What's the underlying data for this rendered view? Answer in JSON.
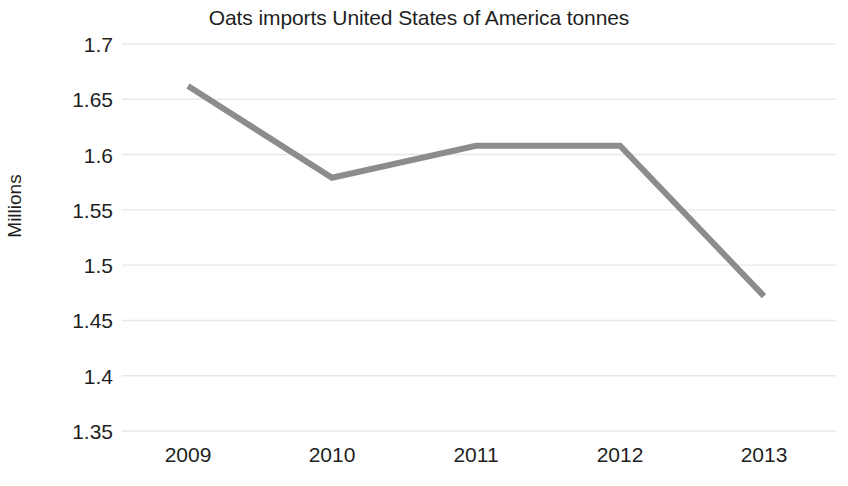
{
  "chart_data": {
    "type": "line",
    "title": "Oats imports United States of America tonnes",
    "xlabel": "",
    "ylabel": "Millions",
    "categories": [
      "2009",
      "2010",
      "2011",
      "2012",
      "2013"
    ],
    "values": [
      1.662,
      1.579,
      1.608,
      1.608,
      1.472
    ],
    "series": [
      {
        "name": "Oats imports United States of America tonnes",
        "values": [
          1.662,
          1.579,
          1.608,
          1.608,
          1.472
        ]
      }
    ],
    "ylim": [
      1.35,
      1.7
    ],
    "ytick_step": 0.05,
    "yticks": [
      "1.7",
      "1.65",
      "1.6",
      "1.55",
      "1.5",
      "1.45",
      "1.4",
      "1.35"
    ],
    "ytick_values": [
      1.7,
      1.65,
      1.6,
      1.55,
      1.5,
      1.45,
      1.4,
      1.35
    ],
    "xticks": [
      "2009",
      "2010",
      "2011",
      "2012",
      "2013"
    ],
    "grid": true,
    "grid_axis": "y",
    "legend": false,
    "legend_position": "none",
    "line_color": "#8c8c8c",
    "grid_color": "#e8e8e8",
    "text_color": "#1f1f1f",
    "background_color": "#ffffff",
    "line_width": 6
  }
}
